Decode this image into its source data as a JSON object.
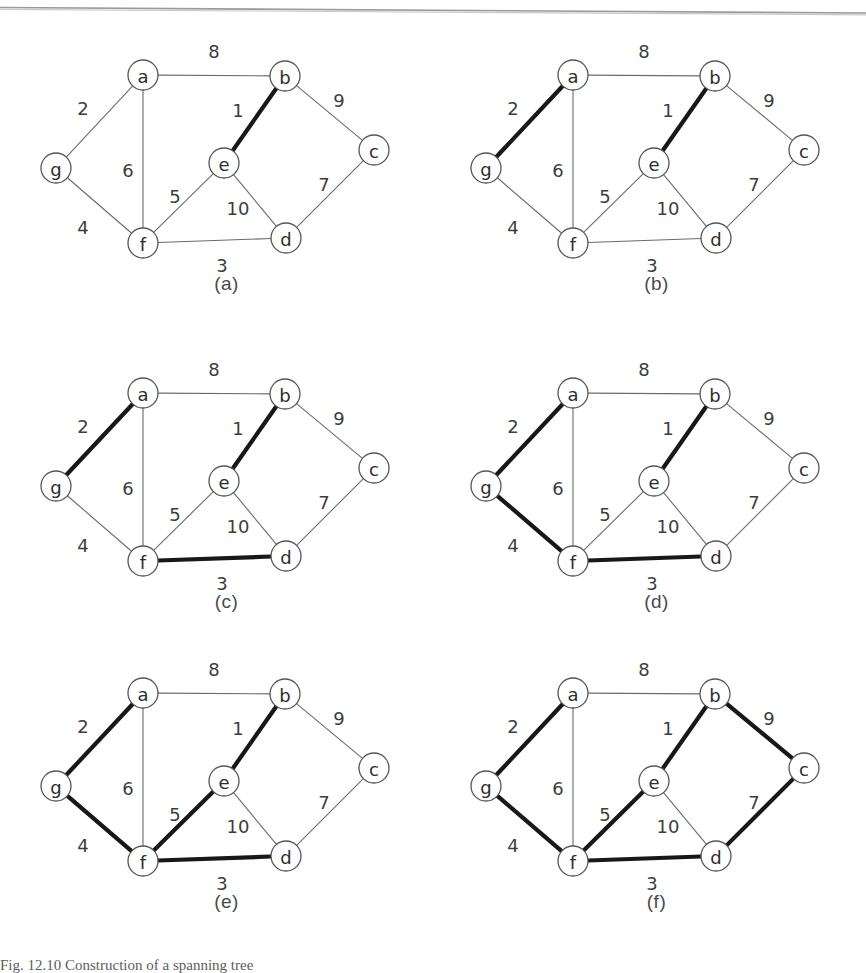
{
  "figure": {
    "caption_number": "Fig. 12.10",
    "caption_text": "Construction of a spanning tree",
    "caption_full": "Fig. 12.10  Construction of a spanning tree"
  },
  "graph": {
    "nodes": [
      {
        "id": "a",
        "label": "a",
        "x": 133,
        "y": 57
      },
      {
        "id": "b",
        "label": "b",
        "x": 275,
        "y": 58
      },
      {
        "id": "c",
        "label": "c",
        "x": 364,
        "y": 132
      },
      {
        "id": "d",
        "label": "d",
        "x": 276,
        "y": 220
      },
      {
        "id": "e",
        "label": "e",
        "x": 214,
        "y": 145
      },
      {
        "id": "f",
        "label": "f",
        "x": 133,
        "y": 225
      },
      {
        "id": "g",
        "label": "g",
        "x": 46,
        "y": 150
      }
    ],
    "node_radius": 15,
    "edges": [
      {
        "id": "a-b",
        "from": "a",
        "to": "b",
        "weight": "8",
        "lx": 204,
        "ly": 33
      },
      {
        "id": "a-g",
        "from": "a",
        "to": "g",
        "weight": "2",
        "lx": 73,
        "ly": 90
      },
      {
        "id": "a-f",
        "from": "a",
        "to": "f",
        "weight": "6",
        "lx": 118,
        "ly": 152
      },
      {
        "id": "b-c",
        "from": "b",
        "to": "c",
        "weight": "9",
        "lx": 329,
        "ly": 82
      },
      {
        "id": "b-e",
        "from": "b",
        "to": "e",
        "weight": "1",
        "lx": 228,
        "ly": 92
      },
      {
        "id": "c-d",
        "from": "c",
        "to": "d",
        "weight": "7",
        "lx": 314,
        "ly": 166
      },
      {
        "id": "d-e",
        "from": "d",
        "to": "e",
        "weight": "10",
        "lx": 228,
        "ly": 190
      },
      {
        "id": "d-f",
        "from": "d",
        "to": "f",
        "weight": "3",
        "lx": 212,
        "ly": 247
      },
      {
        "id": "e-f",
        "from": "e",
        "to": "f",
        "weight": "5",
        "lx": 165,
        "ly": 178
      },
      {
        "id": "f-g",
        "from": "f",
        "to": "g",
        "weight": "4",
        "lx": 73,
        "ly": 209
      }
    ]
  },
  "panels": [
    {
      "key": "a",
      "caption": "(a)",
      "highlighted": [
        "b-e"
      ]
    },
    {
      "key": "b",
      "caption": "(b)",
      "highlighted": [
        "b-e",
        "a-g"
      ]
    },
    {
      "key": "c",
      "caption": "(c)",
      "highlighted": [
        "b-e",
        "a-g",
        "d-f"
      ]
    },
    {
      "key": "d",
      "caption": "(d)",
      "highlighted": [
        "b-e",
        "a-g",
        "d-f",
        "f-g"
      ]
    },
    {
      "key": "e",
      "caption": "(e)",
      "highlighted": [
        "b-e",
        "a-g",
        "d-f",
        "f-g",
        "e-f"
      ]
    },
    {
      "key": "f",
      "caption": "(f)",
      "highlighted": [
        "b-e",
        "a-g",
        "d-f",
        "f-g",
        "e-f",
        "b-c",
        "c-d"
      ]
    }
  ],
  "layout": {
    "panel_positions": [
      {
        "key": "a",
        "left": 10,
        "top": 18
      },
      {
        "key": "b",
        "left": 440,
        "top": 18
      },
      {
        "key": "c",
        "left": 10,
        "top": 336
      },
      {
        "key": "d",
        "left": 440,
        "top": 336
      },
      {
        "key": "e",
        "left": 10,
        "top": 636
      },
      {
        "key": "f",
        "left": 440,
        "top": 636
      }
    ]
  },
  "colors": {
    "background": "#ffffff",
    "edge_normal": "#6b6b6b",
    "edge_bold": "#181818",
    "node_stroke": "#555555",
    "text": "#3a3a3a",
    "scan_line": "#9a9a9a"
  },
  "chart_data": {
    "type": "diagram",
    "title": "Construction of a spanning tree",
    "subtitle": "Fig. 12.10",
    "vertices": [
      "a",
      "b",
      "c",
      "d",
      "e",
      "f",
      "g"
    ],
    "edges": [
      {
        "endpoints": [
          "a",
          "b"
        ],
        "weight": 8
      },
      {
        "endpoints": [
          "a",
          "g"
        ],
        "weight": 2
      },
      {
        "endpoints": [
          "a",
          "f"
        ],
        "weight": 6
      },
      {
        "endpoints": [
          "b",
          "c"
        ],
        "weight": 9
      },
      {
        "endpoints": [
          "b",
          "e"
        ],
        "weight": 1
      },
      {
        "endpoints": [
          "c",
          "d"
        ],
        "weight": 7
      },
      {
        "endpoints": [
          "d",
          "e"
        ],
        "weight": 10
      },
      {
        "endpoints": [
          "d",
          "f"
        ],
        "weight": 3
      },
      {
        "endpoints": [
          "e",
          "f"
        ],
        "weight": 5
      },
      {
        "endpoints": [
          "f",
          "g"
        ],
        "weight": 4
      }
    ],
    "steps": [
      {
        "panel": "(a)",
        "selected_edges": [
          [
            "b",
            "e"
          ]
        ],
        "selected_weights": [
          1
        ],
        "total_weight": 1
      },
      {
        "panel": "(b)",
        "selected_edges": [
          [
            "b",
            "e"
          ],
          [
            "a",
            "g"
          ]
        ],
        "selected_weights": [
          1,
          2
        ],
        "total_weight": 3
      },
      {
        "panel": "(c)",
        "selected_edges": [
          [
            "b",
            "e"
          ],
          [
            "a",
            "g"
          ],
          [
            "d",
            "f"
          ]
        ],
        "selected_weights": [
          1,
          2,
          3
        ],
        "total_weight": 6
      },
      {
        "panel": "(d)",
        "selected_edges": [
          [
            "b",
            "e"
          ],
          [
            "a",
            "g"
          ],
          [
            "d",
            "f"
          ],
          [
            "f",
            "g"
          ]
        ],
        "selected_weights": [
          1,
          2,
          3,
          4
        ],
        "total_weight": 10
      },
      {
        "panel": "(e)",
        "selected_edges": [
          [
            "b",
            "e"
          ],
          [
            "a",
            "g"
          ],
          [
            "d",
            "f"
          ],
          [
            "f",
            "g"
          ],
          [
            "e",
            "f"
          ]
        ],
        "selected_weights": [
          1,
          2,
          3,
          4,
          5
        ],
        "total_weight": 15
      },
      {
        "panel": "(f)",
        "selected_edges": [
          [
            "b",
            "e"
          ],
          [
            "a",
            "g"
          ],
          [
            "d",
            "f"
          ],
          [
            "f",
            "g"
          ],
          [
            "e",
            "f"
          ],
          [
            "b",
            "c"
          ],
          [
            "c",
            "d"
          ]
        ],
        "selected_weights": [
          1,
          2,
          3,
          4,
          5,
          9,
          7
        ],
        "total_weight": 31
      }
    ]
  }
}
